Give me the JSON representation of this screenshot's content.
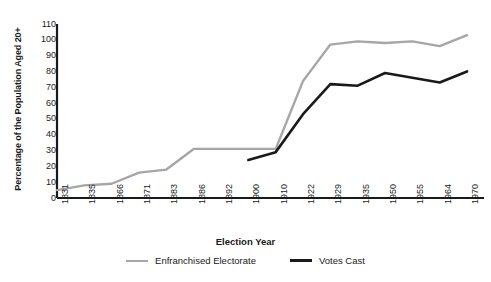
{
  "chart_data": {
    "type": "line",
    "title": "",
    "xlabel": "Election Year",
    "ylabel": "Percentage of the Population Aged 20+",
    "ylim": [
      0,
      110
    ],
    "yticks": [
      0,
      10,
      20,
      30,
      40,
      50,
      60,
      70,
      80,
      90,
      100,
      110
    ],
    "grid": false,
    "legend_position": "bottom",
    "categories": [
      "1831",
      "1835",
      "1866",
      "1871",
      "1883",
      "1886",
      "1892",
      "1900",
      "1910",
      "1922",
      "1929",
      "1935",
      "1950",
      "1955",
      "1964",
      "1970"
    ],
    "series": [
      {
        "name": "Enfranchised Electorate",
        "color": "#a6a6a6",
        "values": [
          5,
          8,
          9,
          16,
          18,
          31,
          31,
          31,
          31,
          74,
          97,
          99,
          98,
          99,
          96,
          103
        ]
      },
      {
        "name": "Votes Cast",
        "color": "#1a1a1a",
        "values": [
          null,
          null,
          null,
          null,
          null,
          null,
          null,
          24,
          29,
          53,
          72,
          71,
          79,
          76,
          73,
          80
        ]
      }
    ]
  },
  "legend": {
    "items": [
      {
        "label": "Enfranchised Electorate",
        "swatch": "gray"
      },
      {
        "label": "Votes Cast",
        "swatch": "black"
      }
    ]
  },
  "axes": {
    "x_title": "Election Year",
    "y_title": "Percentage of the Population Aged 20+"
  }
}
